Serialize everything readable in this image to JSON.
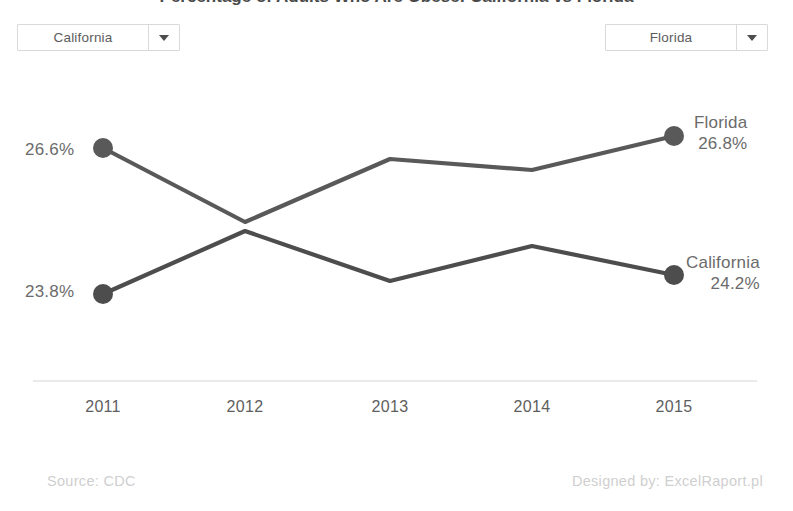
{
  "header": {
    "title": "Percentage of Adults Who Are Obese: California vs Florida"
  },
  "controls": {
    "left_select": {
      "name": "state-select-left",
      "value": "California",
      "caret_icon": "chevron-down-icon"
    },
    "right_select": {
      "name": "state-select-right",
      "value": "Florida",
      "caret_icon": "chevron-down-icon"
    }
  },
  "labels": {
    "start_florida": "26.6%",
    "start_california": "23.8%",
    "end_florida_name": "Florida",
    "end_florida_value": "26.8%",
    "end_california_name": "California",
    "end_california_value": "24.2%"
  },
  "footer": {
    "source": "Source: CDC",
    "credit": "Designed by: ExcelRaport.pl"
  },
  "colors": {
    "line": "#595959",
    "marker": "#4d4d4d",
    "text": "#6b6b6b",
    "axis": "#e0e0e0",
    "background": "#ffffff",
    "dropdown_border": "#d9d9d9"
  },
  "chart_data": {
    "type": "line",
    "title": "Percentage of Adults Who Are Obese: California vs Florida",
    "xlabel": "",
    "ylabel": "",
    "categories": [
      "2011",
      "2012",
      "2013",
      "2014",
      "2015"
    ],
    "grid": false,
    "legend": "end-of-line labels",
    "ylim": [
      22.5,
      27.6
    ],
    "series": [
      {
        "name": "Florida",
        "values": [
          26.6,
          23.7,
          26.1,
          25.7,
          26.8
        ],
        "pixel_y": [
          148,
          222,
          159,
          170,
          136
        ],
        "color": "#595959",
        "endpoint_markers": [
          "2011",
          "2015"
        ]
      },
      {
        "name": "California",
        "values": [
          23.8,
          26.2,
          24.0,
          25.3,
          24.2
        ],
        "pixel_y": [
          294,
          231,
          281,
          246,
          275
        ],
        "color": "#4d4d4d",
        "endpoint_markers": [
          "2011",
          "2015"
        ]
      }
    ],
    "pixel_x": [
      103,
      245,
      390,
      532,
      674
    ],
    "annotations": [
      {
        "text": "26.6%",
        "series": "Florida",
        "category": "2011",
        "position": "left"
      },
      {
        "text": "23.8%",
        "series": "California",
        "category": "2011",
        "position": "left"
      },
      {
        "text": "Florida",
        "series": "Florida",
        "category": "2015",
        "position": "right"
      },
      {
        "text": "26.8%",
        "series": "Florida",
        "category": "2015",
        "position": "right"
      },
      {
        "text": "California",
        "series": "California",
        "category": "2015",
        "position": "right"
      },
      {
        "text": "24.2%",
        "series": "California",
        "category": "2015",
        "position": "right"
      }
    ]
  }
}
